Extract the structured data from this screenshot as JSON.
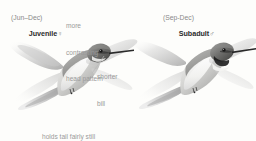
{
  "plate": {
    "background_color": "#fdfdfb",
    "text_color_primary": "#2b2b2b",
    "text_color_secondary": "#8d8d8d",
    "annotation_color": "#9a9a9a"
  },
  "birds": [
    {
      "id": "juvenile-female",
      "name": "Juvenile",
      "sex_symbol": "♀",
      "dates": "(Jun–Dec)",
      "art_name": "hummingbird-juvenile-female-illustration"
    },
    {
      "id": "subadult-male",
      "name": "Subadult",
      "sex_symbol": "♂",
      "dates": "(Sep-Dec)",
      "art_name": "hummingbird-subadult-male-illustration"
    }
  ],
  "annotations": [
    {
      "id": "head-pattern",
      "text": "more\ncontrasting\nhead pattern",
      "line1": "more",
      "line2": "contrasting",
      "line3": "head pattern"
    },
    {
      "id": "shorter-bill",
      "text": "shorter\nbill",
      "line1": "shorter",
      "line2": "bill"
    },
    {
      "id": "tail-behavior",
      "text": "holds tail fairly still\nwhen hovering",
      "line1": "holds tail fairly still",
      "line2": "when hovering"
    }
  ]
}
